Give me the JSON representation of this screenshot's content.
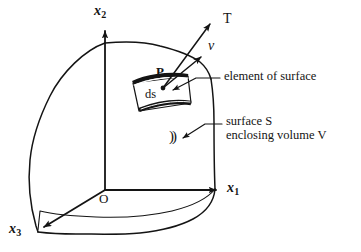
{
  "figure": {
    "kind": "vector-diagram",
    "caption_absent": true,
    "background_color": "#ffffff",
    "ink_color": "#141414",
    "axes": [
      {
        "name": "x2-axis",
        "label_base": "x",
        "label_sub": "2",
        "direction": "up"
      },
      {
        "name": "x1-axis",
        "label_base": "x",
        "label_sub": "1",
        "direction": "right"
      },
      {
        "name": "x3-axis",
        "label_base": "x",
        "label_sub": "3",
        "direction": "lower-left"
      }
    ],
    "origin_label": "O",
    "point_label": "P",
    "vectors": [
      {
        "name": "traction-vector",
        "label": "T",
        "style": "upright"
      },
      {
        "name": "normal-vector",
        "label": "ν",
        "style": "italic"
      }
    ],
    "surface_element_label": "ds",
    "annotations": [
      {
        "name": "element-of-surface",
        "lines": [
          "element of surface"
        ]
      },
      {
        "name": "surface-s",
        "lines": [
          "surface S",
          "enclosing volume V"
        ]
      }
    ],
    "bracket_mark": "))"
  }
}
